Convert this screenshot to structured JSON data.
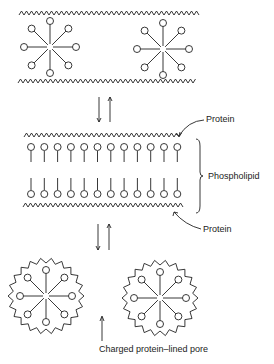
{
  "diagram": {
    "labels": {
      "protein_top": "Protein",
      "phospholipid": "Phospholipid",
      "protein_bottom": "Protein",
      "pore": "Charged protein–lined pore"
    },
    "stages": [
      {
        "name": "top",
        "description": "Micelles between protein layers"
      },
      {
        "name": "middle",
        "description": "Phospholipid bilayer between protein layers"
      },
      {
        "name": "bottom",
        "description": "Protein-coated micelles with pore between"
      }
    ],
    "colors": {
      "stroke": "#222222",
      "background": "#ffffff"
    }
  }
}
